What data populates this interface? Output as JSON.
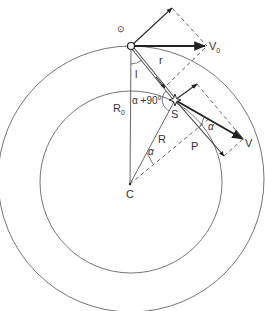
{
  "diagram": {
    "title": "",
    "colors": {
      "stroke": "#444444",
      "thin": "#666666",
      "background": "#ffffff"
    },
    "labels": {
      "observer_symbol": "⊙",
      "V0": "V",
      "V0_sub": "0",
      "r": "r",
      "l": "l",
      "alpha_plus_90": "α +90°",
      "R0": "R",
      "R0_sub": "0",
      "S": "S",
      "alpha_near_V": "α",
      "V": "V",
      "P": "P",
      "R": "R",
      "alpha_near_C": "α",
      "C": "C"
    },
    "points": {
      "observer": [
        131,
        46
      ],
      "star_S": [
        175,
        100
      ],
      "center_C": [
        130,
        184
      ]
    },
    "circles": {
      "inner_radius": 91,
      "outer_radius": 133
    }
  }
}
